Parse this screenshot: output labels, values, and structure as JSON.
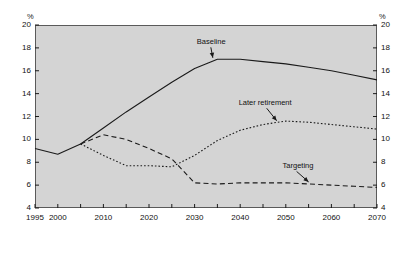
{
  "axes": {
    "unit_left": "%",
    "unit_right": "%",
    "y_ticks": [
      "4",
      "6",
      "8",
      "10",
      "12",
      "14",
      "16",
      "18",
      "20"
    ],
    "x_ticks": [
      "1995",
      "2000",
      "2010",
      "2020",
      "2030",
      "2040",
      "2050",
      "2060",
      "2070"
    ]
  },
  "labels": {
    "baseline": "Baseline",
    "later_retirement": "Later retirement",
    "targeting": "Targeting"
  },
  "colors": {
    "plot_background": "#d4d4d4",
    "frame": "#5a5a5a",
    "line": "#1a1a1a",
    "text": "#111111"
  },
  "chart_data": {
    "type": "line",
    "title": "",
    "xlabel": "",
    "ylabel": "%",
    "xlim": [
      1995,
      2070
    ],
    "ylim": [
      4,
      20
    ],
    "grid": false,
    "legend": "annotations",
    "y_unit": "%",
    "x_ticks_major": [
      1995,
      2000,
      2010,
      2020,
      2030,
      2040,
      2050,
      2060,
      2070
    ],
    "x_ticks_minor_step": 5,
    "y_ticks": [
      4,
      6,
      8,
      10,
      12,
      14,
      16,
      18,
      20
    ],
    "series": [
      {
        "name": "Baseline",
        "style": "solid",
        "x": [
          1995,
          2000,
          2005,
          2010,
          2015,
          2020,
          2025,
          2030,
          2035,
          2040,
          2045,
          2050,
          2055,
          2060,
          2065,
          2070
        ],
        "values": [
          9.2,
          8.7,
          9.6,
          11.0,
          12.4,
          13.7,
          15.0,
          16.2,
          17.0,
          17.0,
          16.8,
          16.6,
          16.3,
          16.0,
          15.6,
          15.2
        ]
      },
      {
        "name": "Later retirement",
        "style": "dotted",
        "x": [
          2005,
          2010,
          2015,
          2020,
          2025,
          2030,
          2035,
          2040,
          2045,
          2050,
          2055,
          2060,
          2065,
          2070
        ],
        "values": [
          9.6,
          8.6,
          7.7,
          7.7,
          7.6,
          8.6,
          9.9,
          10.8,
          11.3,
          11.6,
          11.5,
          11.3,
          11.1,
          10.9
        ]
      },
      {
        "name": "Targeting",
        "style": "dashed",
        "x": [
          2005,
          2010,
          2015,
          2020,
          2025,
          2030,
          2035,
          2040,
          2045,
          2050,
          2055,
          2060,
          2065,
          2070
        ],
        "values": [
          9.6,
          10.4,
          10.0,
          9.2,
          8.3,
          6.2,
          6.1,
          6.2,
          6.2,
          6.2,
          6.1,
          6.0,
          5.9,
          5.8
        ]
      }
    ],
    "annotations": [
      {
        "text": "Baseline",
        "points_to": {
          "x": 2034,
          "y": 17.0
        }
      },
      {
        "text": "Later retirement",
        "points_to": {
          "x": 2048,
          "y": 11.5
        }
      },
      {
        "text": "Targeting",
        "points_to": {
          "x": 2055,
          "y": 6.15
        }
      }
    ]
  }
}
